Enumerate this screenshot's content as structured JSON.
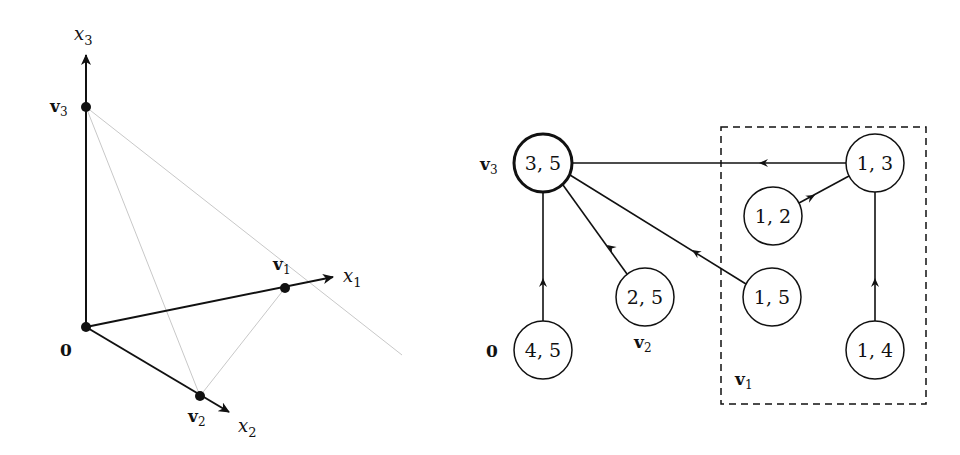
{
  "left_figure": {
    "axes": {
      "x1": {
        "label": "x",
        "sub": "1"
      },
      "x2": {
        "label": "x",
        "sub": "2"
      },
      "x3": {
        "label": "x",
        "sub": "3"
      }
    },
    "points": {
      "origin": {
        "label": "0"
      },
      "v1": {
        "label": "v",
        "sub": "1"
      },
      "v2": {
        "label": "v",
        "sub": "2"
      },
      "v3": {
        "label": "v",
        "sub": "3"
      }
    }
  },
  "right_figure": {
    "nodes": [
      {
        "id": "n35",
        "text": "3, 5",
        "highlighted": true
      },
      {
        "id": "n45",
        "text": "4, 5"
      },
      {
        "id": "n25",
        "text": "2, 5"
      },
      {
        "id": "n15",
        "text": "1, 5"
      },
      {
        "id": "n12",
        "text": "1, 2"
      },
      {
        "id": "n13",
        "text": "1, 3"
      },
      {
        "id": "n14",
        "text": "1, 4"
      }
    ],
    "edges": [
      {
        "from": "n45",
        "to": "n35"
      },
      {
        "from": "n25",
        "to": "n35"
      },
      {
        "from": "n15",
        "to": "n35"
      },
      {
        "from": "n13",
        "to": "n35"
      },
      {
        "from": "n12",
        "to": "n13"
      },
      {
        "from": "n14",
        "to": "n13"
      }
    ],
    "labels": {
      "v3": {
        "label": "v",
        "sub": "3"
      },
      "origin": {
        "label": "0"
      },
      "v2": {
        "label": "v",
        "sub": "2"
      },
      "v1": {
        "label": "v",
        "sub": "1"
      }
    },
    "group_box": {
      "label_ref": "v1",
      "style": "dashed"
    }
  }
}
